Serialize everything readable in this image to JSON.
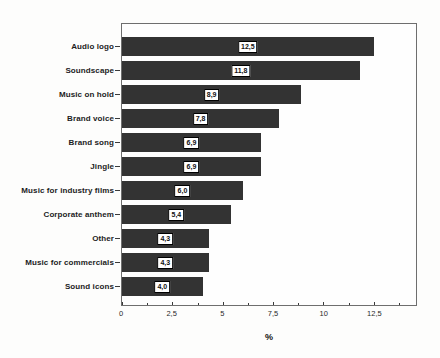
{
  "chart_data": {
    "type": "bar",
    "orientation": "horizontal",
    "title": "",
    "xlabel": "%",
    "categories": [
      "Audio logo",
      "Soundscape",
      "Music on hold",
      "Brand voice",
      "Brand song",
      "Jingle",
      "Music for industry films",
      "Corporate anthem",
      "Other",
      "Music for commercials",
      "Sound icons"
    ],
    "values": [
      12.5,
      11.8,
      8.9,
      7.8,
      6.9,
      6.9,
      6.0,
      5.4,
      4.3,
      4.3,
      4.0
    ],
    "value_labels": [
      "12,5",
      "11,8",
      "8,9",
      "7,8",
      "6,9",
      "6,9",
      "6,0",
      "5,4",
      "4,3",
      "4,3",
      "4,0"
    ],
    "x_ticks": [
      0,
      2.5,
      5,
      7.5,
      10,
      12.5
    ],
    "x_tick_labels": [
      "0",
      "2,5",
      "5",
      "7,5",
      "10",
      "12,5"
    ],
    "x_minor_ticks": [
      1.25,
      3.75,
      6.25,
      8.75,
      11.25,
      13.75
    ],
    "xlim": [
      0,
      14.6
    ],
    "grid": false,
    "legend": false,
    "bar_color": "#333333",
    "label_box_bg": "#ffffff",
    "label_box_border": "#000000"
  }
}
